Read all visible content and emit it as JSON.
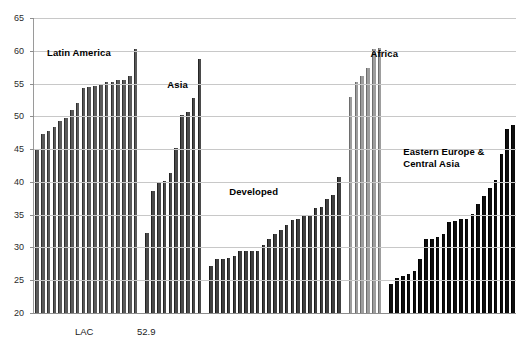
{
  "chart_data": {
    "type": "bar",
    "title": "",
    "subtitle": "",
    "xlabel": "",
    "ylabel": "",
    "ylim": [
      20,
      65
    ],
    "ytick_step": 5,
    "yticks": [
      20,
      25,
      30,
      35,
      40,
      45,
      50,
      55,
      60,
      65
    ],
    "grid": true,
    "legend": false,
    "legend_position": "none",
    "xticklabels": [],
    "annotations": [
      {
        "text": "LAC",
        "x_px": 75,
        "y_px": 327
      },
      {
        "text": "52.9",
        "x_px": 137,
        "y_px": 327
      }
    ],
    "group_labels": [
      {
        "text": "Latin America",
        "color": "#000000"
      },
      {
        "text": "Asia",
        "color": "#000000"
      },
      {
        "text": "Developed",
        "color": "#000000"
      },
      {
        "text": "Africa",
        "color": "#000000"
      },
      {
        "text": "Eastern Europe &\nCentral Asia",
        "color": "#000000"
      }
    ],
    "series": [
      {
        "name": "Latin America",
        "color": "#5a5a5a",
        "values": [
          45.0,
          47.3,
          47.7,
          48.4,
          49.3,
          49.7,
          51.0,
          52.1,
          54.4,
          54.5,
          54.7,
          55.0,
          55.2,
          55.3,
          55.5,
          55.6,
          56.2,
          60.2
        ]
      },
      {
        "name": "Asia",
        "color": "#4a4a4a",
        "values": [
          32.2,
          38.6,
          39.8,
          40.1,
          41.4,
          45.2,
          50.2,
          50.6,
          52.8,
          58.7
        ]
      },
      {
        "name": "Developed",
        "color": "#3f3f3f",
        "values": [
          27.2,
          28.3,
          28.3,
          28.4,
          28.7,
          29.4,
          29.4,
          29.4,
          29.4,
          30.3,
          31.3,
          32.1,
          32.6,
          33.5,
          34.2,
          34.4,
          35.0,
          35.0,
          36.0,
          36.1,
          37.4,
          38.0,
          40.8
        ]
      },
      {
        "name": "Africa",
        "color": "#9d9d9d",
        "values": [
          53.0,
          55.3,
          56.2,
          57.3,
          60.2,
          60.4
        ]
      },
      {
        "name": "Eastern Europe & Central Asia",
        "color": "#0e0e0e",
        "values": [
          24.4,
          25.3,
          25.7,
          26.0,
          26.4,
          28.3,
          31.3,
          31.3,
          31.6,
          32.0,
          33.9,
          34.1,
          34.3,
          34.4,
          35.1,
          36.6,
          37.8,
          39.1,
          40.3,
          44.2,
          48.1,
          48.7
        ]
      }
    ],
    "axis": {
      "y_min_label": "20",
      "y_max_label": "65"
    }
  }
}
